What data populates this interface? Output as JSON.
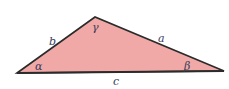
{
  "diagram": {
    "type": "triangle",
    "fill_color": "#f0a9a6",
    "stroke_color": "#2b2b2b",
    "vertices": {
      "left": [
        17,
        73
      ],
      "top": [
        95,
        17
      ],
      "right": [
        224,
        71
      ]
    },
    "sides": {
      "a": "a",
      "b": "b",
      "c": "c"
    },
    "angles": {
      "alpha": "α",
      "beta": "β",
      "gamma": "γ"
    }
  }
}
